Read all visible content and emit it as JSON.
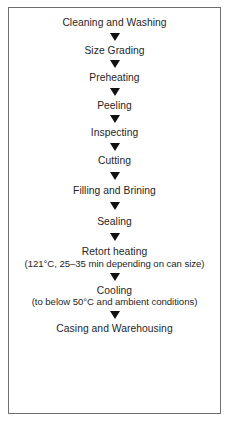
{
  "diagram": {
    "frame": {
      "border_color": "#6e6e6e",
      "background_color": "#ffffff"
    },
    "arrow": {
      "icon": "triangle-down-icon",
      "color": "#111111"
    },
    "text_color": "#262626",
    "steps": [
      {
        "label": "Cleaning and Washing",
        "sub": ""
      },
      {
        "label": "Size Grading",
        "sub": ""
      },
      {
        "label": "Preheating",
        "sub": ""
      },
      {
        "label": "Peeling",
        "sub": ""
      },
      {
        "label": "Inspecting",
        "sub": ""
      },
      {
        "label": "Cutting",
        "sub": ""
      },
      {
        "label": "Filling and Brining",
        "sub": ""
      },
      {
        "label": "Sealing",
        "sub": ""
      },
      {
        "label": "Retort heating",
        "sub": "(121°C, 25–35 min depending on can size)"
      },
      {
        "label": "Cooling",
        "sub": "(to below 50°C and ambient conditions)"
      },
      {
        "label": "Casing and Warehousing",
        "sub": ""
      }
    ]
  }
}
